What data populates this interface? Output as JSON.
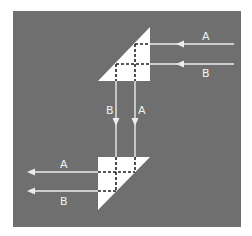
{
  "figure": {
    "background_color": "#6f6f6f",
    "prism_color": "#ffffff",
    "ray_color": "#ececec",
    "dash_color": "#222222"
  },
  "rays": {
    "incoming": [
      {
        "label": "A",
        "direction": "left"
      },
      {
        "label": "B",
        "direction": "left"
      }
    ],
    "vertical": [
      {
        "label": "B",
        "direction": "down"
      },
      {
        "label": "A",
        "direction": "down"
      }
    ],
    "outgoing": [
      {
        "label": "A",
        "direction": "left"
      },
      {
        "label": "B",
        "direction": "left"
      }
    ]
  },
  "prisms": [
    {
      "name": "upper-prism",
      "orientation": "hypotenuse facing lower-left"
    },
    {
      "name": "lower-prism",
      "orientation": "hypotenuse facing lower-right"
    }
  ]
}
